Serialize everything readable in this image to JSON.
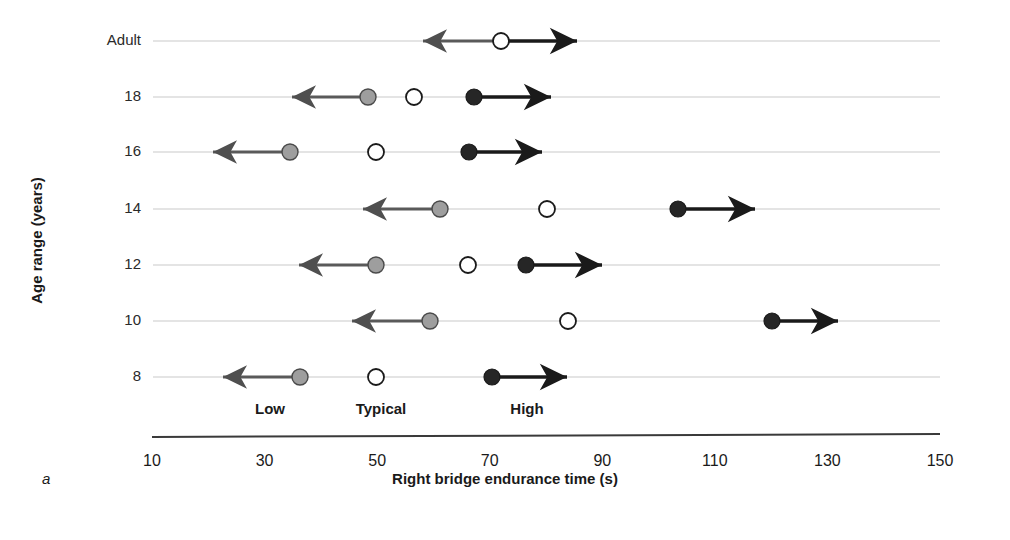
{
  "figure": {
    "panel_letter": "a",
    "xaxis_title": "Right bridge endurance time (s)",
    "yaxis_title": "Age range (years)"
  },
  "legend": {
    "items": [
      {
        "label": "Low",
        "marker": "gray-filled-circle",
        "color": "#9e9e9e",
        "x_center": 270
      },
      {
        "label": "Typical",
        "marker": "white-open-circle",
        "color": "#ffffff",
        "x_center": 381
      },
      {
        "label": "High",
        "marker": "black-filled-circle",
        "color": "#262626",
        "x_center": 527
      }
    ]
  },
  "chart_data": {
    "type": "scatter",
    "title": "",
    "xlabel": "Right bridge endurance time (s)",
    "ylabel": "Age range (years)",
    "xlim": [
      10,
      150
    ],
    "xticks": [
      10,
      30,
      50,
      70,
      90,
      110,
      130,
      150
    ],
    "xticklabels": [
      "10",
      "30",
      "50",
      "70",
      "90",
      "110",
      "130",
      "150"
    ],
    "categories": [
      "Adult",
      "18",
      "16",
      "14",
      "12",
      "10",
      "8"
    ],
    "grid": "horizontal-rowlines",
    "legend_position": "below-plot",
    "series": [
      {
        "name": "Low",
        "marker": "gray-filled-circle",
        "color": "#9e9e9e",
        "values": [
          null,
          50,
          35,
          60,
          51,
          60,
          37
        ]
      },
      {
        "name": "Typical",
        "marker": "white-open-circle",
        "color": "#ffffff",
        "values": [
          74,
          58,
          51,
          82,
          68,
          86,
          51
        ]
      },
      {
        "name": "High",
        "marker": "black-filled-circle",
        "color": "#262626",
        "values": [
          null,
          69,
          68,
          106,
          78,
          123,
          72
        ]
      }
    ],
    "rows": [
      {
        "category": "Adult",
        "y_px": 41,
        "markers": [
          {
            "series": "Typical",
            "value": 74,
            "x_px": 501
          }
        ],
        "arrows": [
          {
            "from_value": 74,
            "to_value": 60,
            "direction": "left",
            "from_px": 501,
            "to_px": 423
          },
          {
            "from_value": 74,
            "to_value": 87,
            "direction": "right",
            "from_px": 501,
            "to_px": 577
          }
        ]
      },
      {
        "category": "18",
        "y_px": 97,
        "markers": [
          {
            "series": "Low",
            "value": 50,
            "x_px": 368
          },
          {
            "series": "Typical",
            "value": 58,
            "x_px": 414
          },
          {
            "series": "High",
            "value": 69,
            "x_px": 474
          }
        ],
        "arrows": [
          {
            "from_value": 50,
            "to_value": 36,
            "direction": "left",
            "from_px": 368,
            "to_px": 292
          },
          {
            "from_value": 69,
            "to_value": 83,
            "direction": "right",
            "from_px": 474,
            "to_px": 551
          }
        ]
      },
      {
        "category": "16",
        "y_px": 152,
        "markers": [
          {
            "series": "Low",
            "value": 35,
            "x_px": 290
          },
          {
            "series": "Typical",
            "value": 51,
            "x_px": 376
          },
          {
            "series": "High",
            "value": 68,
            "x_px": 469
          }
        ],
        "arrows": [
          {
            "from_value": 35,
            "to_value": 21,
            "direction": "left",
            "from_px": 290,
            "to_px": 213
          },
          {
            "from_value": 68,
            "to_value": 81,
            "direction": "right",
            "from_px": 469,
            "to_px": 542
          }
        ]
      },
      {
        "category": "14",
        "y_px": 209,
        "markers": [
          {
            "series": "Low",
            "value": 60,
            "x_px": 440
          },
          {
            "series": "Typical",
            "value": 82,
            "x_px": 547
          },
          {
            "series": "High",
            "value": 106,
            "x_px": 678
          }
        ],
        "arrows": [
          {
            "from_value": 60,
            "to_value": 49,
            "direction": "left",
            "from_px": 440,
            "to_px": 363
          },
          {
            "from_value": 106,
            "to_value": 120,
            "direction": "right",
            "from_px": 678,
            "to_px": 755
          }
        ]
      },
      {
        "category": "12",
        "y_px": 265,
        "markers": [
          {
            "series": "Low",
            "value": 51,
            "x_px": 376
          },
          {
            "series": "Typical",
            "value": 68,
            "x_px": 468
          },
          {
            "series": "High",
            "value": 78,
            "x_px": 526
          }
        ],
        "arrows": [
          {
            "from_value": 51,
            "to_value": 37,
            "direction": "left",
            "from_px": 376,
            "to_px": 299
          },
          {
            "from_value": 78,
            "to_value": 92,
            "direction": "right",
            "from_px": 526,
            "to_px": 602
          }
        ]
      },
      {
        "category": "10",
        "y_px": 321,
        "markers": [
          {
            "series": "Low",
            "value": 60,
            "x_px": 430
          },
          {
            "series": "Typical",
            "value": 86,
            "x_px": 568
          },
          {
            "series": "High",
            "value": 123,
            "x_px": 772
          }
        ],
        "arrows": [
          {
            "from_value": 60,
            "to_value": 47,
            "direction": "left",
            "from_px": 430,
            "to_px": 352
          },
          {
            "from_value": 123,
            "to_value": 135,
            "direction": "right",
            "from_px": 772,
            "to_px": 838
          }
        ]
      },
      {
        "category": "8",
        "y_px": 377,
        "markers": [
          {
            "series": "Low",
            "value": 37,
            "x_px": 300
          },
          {
            "series": "Typical",
            "value": 51,
            "x_px": 376
          },
          {
            "series": "High",
            "value": 72,
            "x_px": 492
          }
        ],
        "arrows": [
          {
            "from_value": 37,
            "to_value": 23,
            "direction": "left",
            "from_px": 300,
            "to_px": 223
          },
          {
            "from_value": 72,
            "to_value": 86,
            "direction": "right",
            "from_px": 492,
            "to_px": 567
          }
        ]
      }
    ]
  },
  "geometry": {
    "row_line_x_start": 153,
    "row_line_x_end": 940,
    "axis_y": 437,
    "axis_x_start": 152,
    "axis_x_end": 940,
    "tick_y_label": 452,
    "legend_y": 400,
    "xaxis_title_x": 545,
    "xaxis_title_y": 478,
    "panel_letter_x": 42,
    "panel_letter_y": 478
  },
  "colors": {
    "low": "#9e9e9e",
    "typical": "#ffffff",
    "high": "#262626",
    "low_arrow": "#5a5a5a",
    "high_arrow": "#1a1a1a",
    "rowline": "#c9c9c9",
    "axis": "#3a3a3a",
    "text": "#1a1a1a"
  }
}
